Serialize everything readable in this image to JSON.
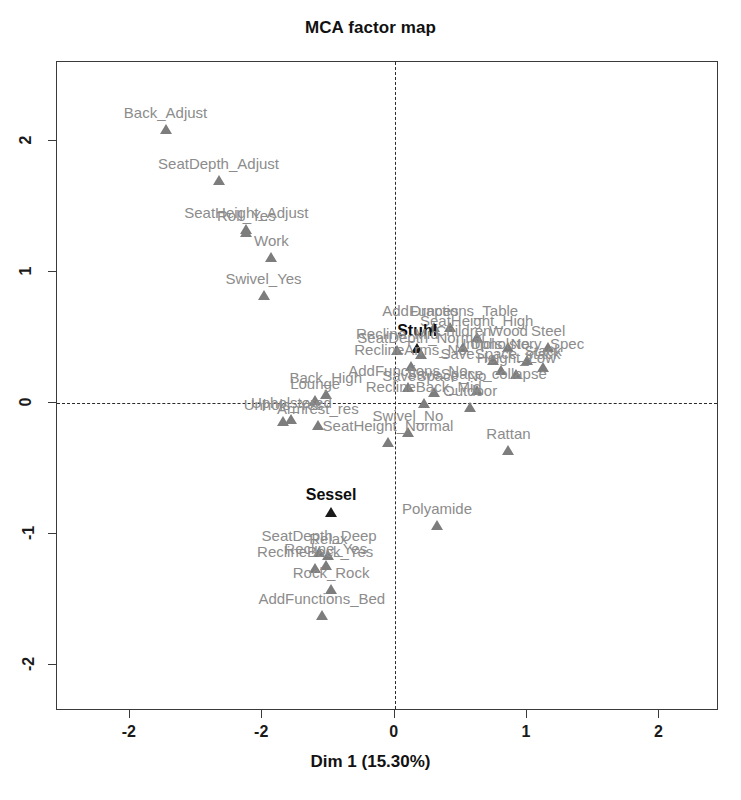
{
  "chart_data": {
    "type": "scatter",
    "title": "MCA factor map",
    "xlabel": "Dim 1 (15.30%)",
    "ylabel": "",
    "xlim": [
      -2.55,
      2.45
    ],
    "ylim": [
      -2.35,
      2.6
    ],
    "grid": false,
    "legend": null,
    "xticks": [
      -2,
      -1,
      0,
      1,
      2
    ],
    "xticklabels": [
      "-2",
      "-2",
      "0",
      "1",
      "2"
    ],
    "yticks": [
      2,
      1,
      0,
      -1,
      -2
    ],
    "yticklabels": [
      "2",
      "1",
      "0",
      "-1",
      "-2"
    ],
    "reference_lines": {
      "vertical_x": 0,
      "horizontal_y": 0,
      "style": "dashed"
    },
    "marker": "triangle",
    "colors": {
      "point": "#7d7d7d",
      "label": "#8c8c8c",
      "highlight": "#0d0d0d",
      "frame": "#3a3a3a"
    },
    "points": [
      {
        "label": "Back_Adjust",
        "x": -1.73,
        "y": 2.09,
        "highlight": false
      },
      {
        "label": "SeatDepth_Adjust",
        "x": -1.33,
        "y": 1.7,
        "highlight": false
      },
      {
        "label": "SeatHeight_Adjust",
        "x": -1.12,
        "y": 1.33,
        "highlight": false
      },
      {
        "label": "Roll_Yes",
        "x": -1.12,
        "y": 1.3,
        "highlight": false
      },
      {
        "label": "Work",
        "x": -0.93,
        "y": 1.11,
        "highlight": false
      },
      {
        "label": "Swivel_Yes",
        "x": -0.99,
        "y": 0.82,
        "highlight": false
      },
      {
        "label": "AddFunctions_Table",
        "x": 0.42,
        "y": 0.58,
        "highlight": false
      },
      {
        "label": "Drapes",
        "x": 0.3,
        "y": 0.58,
        "highlight": false
      },
      {
        "label": "SeatHeight_High",
        "x": 0.62,
        "y": 0.5,
        "highlight": false
      },
      {
        "label": "Children",
        "x": 0.52,
        "y": 0.43,
        "highlight": false
      },
      {
        "label": "Wood",
        "x": 0.86,
        "y": 0.43,
        "highlight": false
      },
      {
        "label": "Steel",
        "x": 1.16,
        "y": 0.43,
        "highlight": false
      },
      {
        "label": "Stuhl",
        "x": 0.17,
        "y": 0.42,
        "highlight": true
      },
      {
        "label": "Recline_Mid",
        "x": 0.02,
        "y": 0.4,
        "highlight": false
      },
      {
        "label": "SeatDepth_Normal",
        "x": 0.2,
        "y": 0.37,
        "highlight": false
      },
      {
        "label": "Upholstery_Spec",
        "x": 1.0,
        "y": 0.33,
        "highlight": false
      },
      {
        "label": "Unhols_No",
        "x": 0.74,
        "y": 0.33,
        "highlight": false
      },
      {
        "label": "ReclineArms_No",
        "x": 0.12,
        "y": 0.28,
        "highlight": false
      },
      {
        "label": "Stack",
        "x": 1.12,
        "y": 0.27,
        "highlight": false
      },
      {
        "label": "SaveSpace_stack",
        "x": 0.8,
        "y": 0.25,
        "highlight": false
      },
      {
        "label": "Height_Low",
        "x": 0.92,
        "y": 0.22,
        "highlight": false
      },
      {
        "label": "AddFunctions_No",
        "x": 0.1,
        "y": 0.12,
        "highlight": false
      },
      {
        "label": "SaveSpace_collapse",
        "x": 0.62,
        "y": 0.1,
        "highlight": false
      },
      {
        "label": "SaveSpace_No",
        "x": 0.3,
        "y": 0.08,
        "highlight": false
      },
      {
        "label": "Back_High",
        "x": -0.52,
        "y": 0.07,
        "highlight": false
      },
      {
        "label": "Lounge",
        "x": -0.6,
        "y": 0.02,
        "highlight": false
      },
      {
        "label": "ReclineBack_Mid",
        "x": 0.22,
        "y": 0.0,
        "highlight": false
      },
      {
        "label": "Outdoor",
        "x": 0.57,
        "y": -0.03,
        "highlight": false
      },
      {
        "label": "Upholstered",
        "x": -0.78,
        "y": -0.12,
        "highlight": false
      },
      {
        "label": "Unhols_Yes",
        "x": -0.84,
        "y": -0.14,
        "highlight": false
      },
      {
        "label": "Armrest_res",
        "x": -0.58,
        "y": -0.17,
        "highlight": false
      },
      {
        "label": "Swivel_No",
        "x": 0.1,
        "y": -0.22,
        "highlight": false
      },
      {
        "label": "SeatHeight_Normal",
        "x": -0.05,
        "y": -0.3,
        "highlight": false
      },
      {
        "label": "Rattan",
        "x": 0.86,
        "y": -0.36,
        "highlight": false
      },
      {
        "label": "Sessel",
        "x": -0.48,
        "y": -0.83,
        "highlight": true
      },
      {
        "label": "Polyamide",
        "x": 0.32,
        "y": -0.93,
        "highlight": false
      },
      {
        "label": "SeatDepth_Deep",
        "x": -0.57,
        "y": -1.14,
        "highlight": false
      },
      {
        "label": "Relax",
        "x": -0.5,
        "y": -1.16,
        "highlight": false
      },
      {
        "label": "ReclineBack_Yes",
        "x": -0.6,
        "y": -1.26,
        "highlight": false
      },
      {
        "label": "Recline_Yes",
        "x": -0.52,
        "y": -1.24,
        "highlight": false
      },
      {
        "label": "Rock_Rock",
        "x": -0.48,
        "y": -1.42,
        "highlight": false
      },
      {
        "label": "AddFunctions_Bed",
        "x": -0.55,
        "y": -1.62,
        "highlight": false
      }
    ]
  }
}
